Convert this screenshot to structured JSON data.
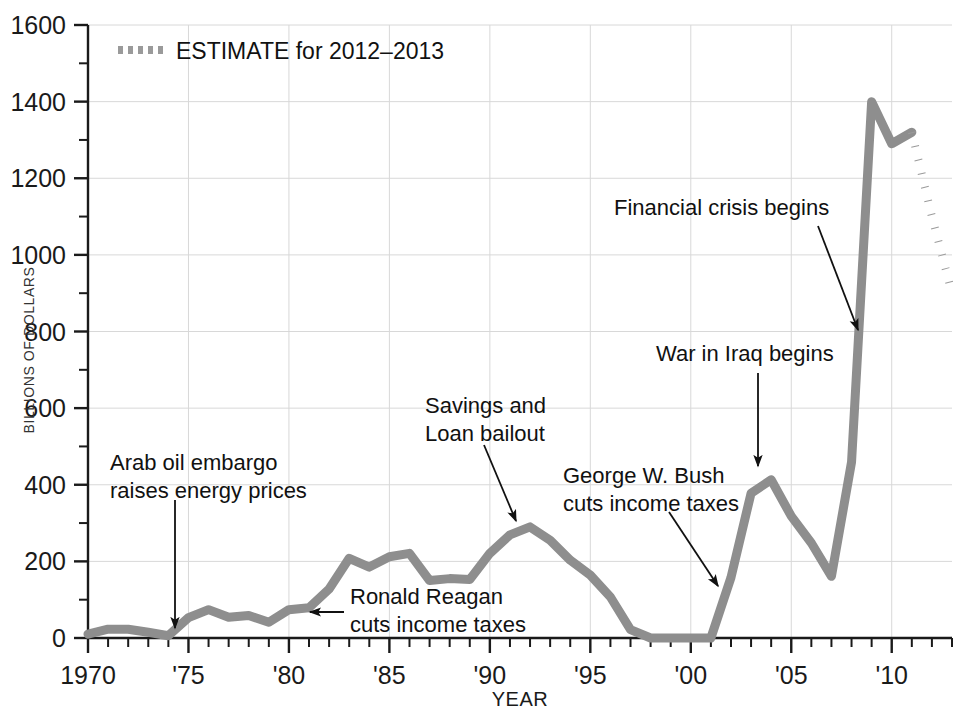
{
  "chart_data": {
    "type": "line",
    "title": "",
    "xlabel": "YEAR",
    "ylabel": "BILLIONS OF DOLLARS",
    "xlim": [
      1970,
      2013
    ],
    "ylim": [
      0,
      1600
    ],
    "grid": true,
    "legend_position": "top-left",
    "series": [
      {
        "name": "Federal budget deficit",
        "style": "solid",
        "color": "#8e8e8e",
        "x": [
          1970,
          1971,
          1972,
          1973,
          1974,
          1975,
          1976,
          1977,
          1978,
          1979,
          1980,
          1981,
          1982,
          1983,
          1984,
          1985,
          1986,
          1987,
          1988,
          1989,
          1990,
          1991,
          1992,
          1993,
          1994,
          1995,
          1996,
          1997,
          1998,
          1999,
          2000,
          2001,
          2002,
          2003,
          2004,
          2005,
          2006,
          2007,
          2008,
          2009,
          2010,
          2011
        ],
        "y": [
          10,
          23,
          23,
          15,
          6,
          53,
          74,
          54,
          59,
          41,
          74,
          79,
          128,
          208,
          185,
          212,
          221,
          150,
          155,
          153,
          221,
          269,
          290,
          255,
          203,
          164,
          107,
          22,
          0,
          0,
          0,
          0,
          158,
          378,
          413,
          318,
          248,
          161,
          459,
          1400,
          1290,
          1320
        ]
      },
      {
        "name": "ESTIMATE for 2012-2013",
        "style": "dotted",
        "color": "#9a9a9a",
        "x": [
          2011,
          2012,
          2013
        ],
        "y": [
          1320,
          1100,
          900
        ]
      }
    ],
    "y_ticks": [
      0,
      200,
      400,
      600,
      800,
      1000,
      1200,
      1400,
      1600
    ],
    "y_tick_labels": [
      "0",
      "200",
      "400",
      "600",
      "800",
      "1000",
      "1200",
      "1400",
      "1600"
    ],
    "y_minor_ticks": [
      100,
      300,
      500,
      700,
      900,
      1100,
      1300,
      1500
    ],
    "x_ticks": [
      1970,
      1975,
      1980,
      1985,
      1990,
      1995,
      2000,
      2005,
      2010
    ],
    "x_tick_labels": [
      "1970",
      "'75",
      "'80",
      "'85",
      "'90",
      "'95",
      "'00",
      "'05",
      "'10"
    ],
    "annotations": [
      {
        "id": "arab-oil-embargo",
        "lines": [
          "Arab oil embargo",
          "raises energy prices"
        ],
        "text_x": 110,
        "text_y": 470,
        "anchor": "start",
        "arrow": {
          "x1": 175,
          "y1": 500,
          "x2": 175,
          "y2": 628
        }
      },
      {
        "id": "ronald-reagan",
        "lines": [
          "Ronald Reagan",
          "cuts income taxes"
        ],
        "text_x": 350,
        "text_y": 604,
        "anchor": "start",
        "arrow": {
          "x1": 344,
          "y1": 612,
          "x2": 310,
          "y2": 612
        }
      },
      {
        "id": "savings-and-loan",
        "lines": [
          "Savings and",
          "Loan bailout"
        ],
        "text_x": 425,
        "text_y": 413,
        "anchor": "start",
        "arrow": {
          "x1": 484,
          "y1": 445,
          "x2": 516,
          "y2": 521
        }
      },
      {
        "id": "george-w-bush",
        "lines": [
          "George W. Bush",
          "cuts income taxes"
        ],
        "text_x": 563,
        "text_y": 483,
        "anchor": "start",
        "arrow": {
          "x1": 669,
          "y1": 512,
          "x2": 718,
          "y2": 586
        }
      },
      {
        "id": "war-in-iraq",
        "lines": [
          "War in Iraq begins"
        ],
        "text_x": 656,
        "text_y": 361,
        "anchor": "start",
        "arrow": {
          "x1": 758,
          "y1": 373,
          "x2": 758,
          "y2": 466
        }
      },
      {
        "id": "financial-crisis",
        "lines": [
          "Financial crisis begins"
        ],
        "text_x": 614,
        "text_y": 215,
        "anchor": "start",
        "arrow": {
          "x1": 818,
          "y1": 226,
          "x2": 858,
          "y2": 330
        }
      }
    ],
    "legend": [
      {
        "label": "ESTIMATE for 2012–2013",
        "marker": "dotted-swatch",
        "color": "#9a9a9a"
      }
    ]
  },
  "axes": {
    "x_label": "YEAR",
    "y_label": "BILLIONS OF DOLLARS"
  },
  "colors": {
    "line": "#8e8e8e",
    "estimate": "#9a9a9a",
    "grid": "#d8d8d8",
    "axis": "#1a1a1a",
    "text": "#111111",
    "background": "#ffffff"
  }
}
